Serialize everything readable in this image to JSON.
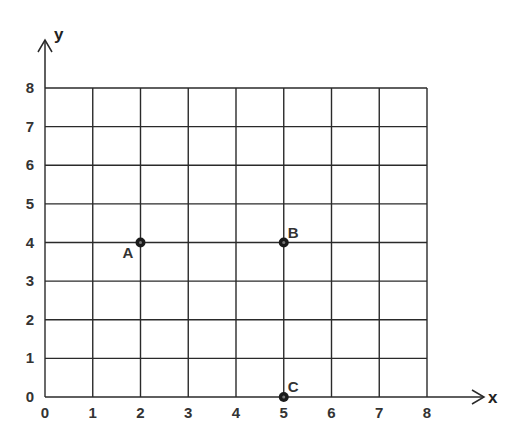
{
  "chart_data": {
    "type": "scatter",
    "title": "",
    "xlabel": "x",
    "ylabel": "y",
    "xlim": [
      0,
      8
    ],
    "ylim": [
      0,
      8
    ],
    "grid": true,
    "x_ticks": [
      "0",
      "1",
      "2",
      "3",
      "4",
      "5",
      "6",
      "7",
      "8"
    ],
    "y_ticks": [
      "0",
      "1",
      "2",
      "3",
      "4",
      "5",
      "6",
      "7",
      "8"
    ],
    "points": [
      {
        "label": "A",
        "x": 2,
        "y": 4
      },
      {
        "label": "B",
        "x": 5,
        "y": 4
      },
      {
        "label": "C",
        "x": 5,
        "y": 0
      }
    ]
  },
  "style": {
    "grid_color": "#2a2a2a",
    "point_color": "#1a1a1a",
    "text_color": "#333333"
  }
}
